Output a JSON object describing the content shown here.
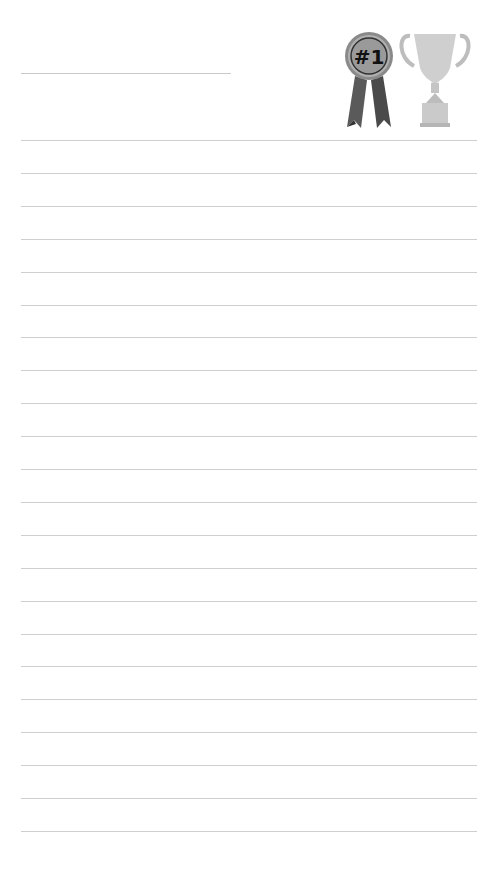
{
  "page": {
    "type": "lined-notepad",
    "background": "#ffffff",
    "line_color": "#cfcfcf"
  },
  "header": {
    "title_line": {
      "value": ""
    },
    "decorations": [
      {
        "name": "first-place-ribbon-icon",
        "label": "#1"
      },
      {
        "name": "trophy-cup-icon"
      }
    ]
  },
  "ruled_lines": {
    "count": 22,
    "start_y": 140,
    "spacing": 32.9
  }
}
